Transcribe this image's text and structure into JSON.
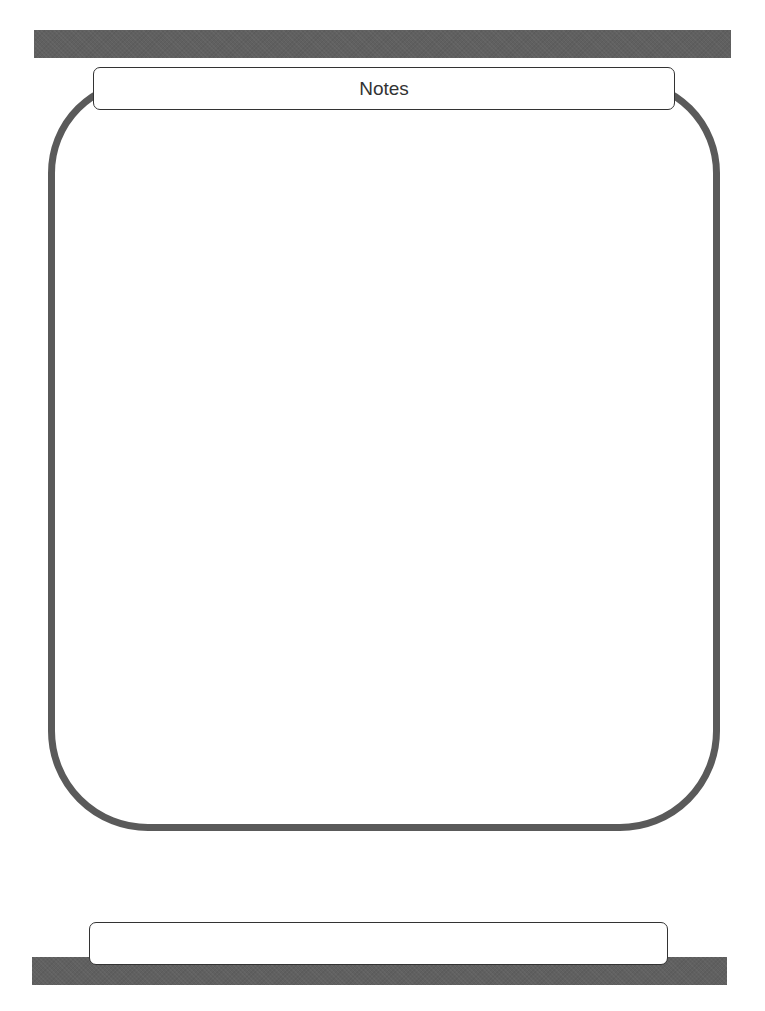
{
  "page": {
    "title": "Notes",
    "footer_label": "",
    "notes_content": ""
  },
  "colors": {
    "bar": "#606060",
    "frame_stroke": "#5a5a5a",
    "label_border": "#333333",
    "background": "#ffffff",
    "text": "#333333"
  }
}
